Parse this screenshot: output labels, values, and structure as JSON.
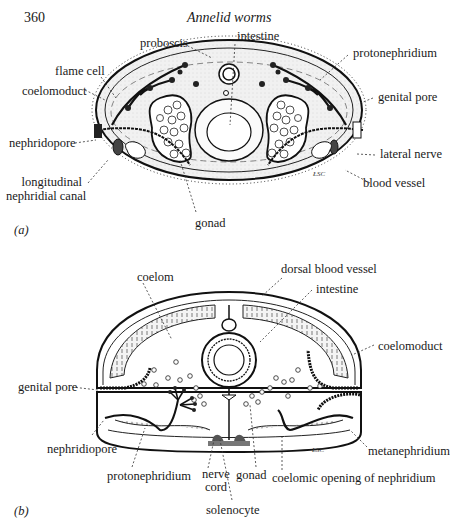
{
  "page": {
    "number": "360",
    "running_title": "Annelid worms"
  },
  "figure_a": {
    "panel_label": "(a)",
    "labels": {
      "proboscis": "proboscis",
      "intestine": "intestine",
      "protonephridium": "protonephridium",
      "flame_cell": "flame cell",
      "coelomoduct": "coelomoduct",
      "genital_pore": "genital pore",
      "nephridopore": "nephridopore",
      "lateral_nerve": "lateral nerve",
      "longitudinal_1": "longitudinal",
      "longitudinal_2": "nephridial canal",
      "blood_vessel": "blood vessel",
      "gonad": "gonad"
    },
    "signature": "ŁSC"
  },
  "figure_b": {
    "panel_label": "(b)",
    "labels": {
      "coelom": "coelom",
      "dorsal_blood_vessel": "dorsal blood vessel",
      "intestine": "intestine",
      "coelomoduct": "coelomoduct",
      "genital_pore": "genital pore",
      "nephridiopore": "nephridiopore",
      "metanephridium": "metanephridium",
      "protonephridium": "protonephridium",
      "nerve_cord_1": "nerve",
      "nerve_cord_2": "cord",
      "gonad": "gonad",
      "coelomic_opening": "coelomic opening of nephridium",
      "solenocyte": "solenocyte"
    },
    "signature": "ŁSC"
  }
}
